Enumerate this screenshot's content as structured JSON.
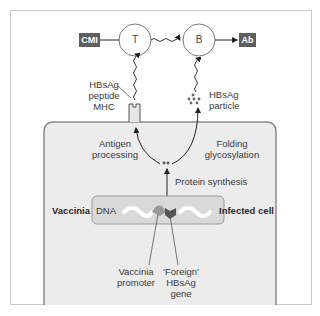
{
  "diagram": {
    "nodes": {
      "cmi": "CMI",
      "t_cell": "T",
      "b_cell": "B",
      "ab": "Ab"
    },
    "labels": {
      "hbsag_peptide_mhc": [
        "HBsAg",
        "peptide",
        "MHC"
      ],
      "hbsag_particle": [
        "HBsAg",
        "particle"
      ],
      "antigen_processing": [
        "Antigen",
        "processing"
      ],
      "folding_glycosylation": [
        "Folding",
        "glycosylation"
      ],
      "protein_synthesis": "Protein synthesis",
      "vaccinia": "Vaccinia",
      "dna": "DNA",
      "infected_cell": "Infected cell",
      "vaccinia_promoter": [
        "Vaccinia",
        "promoter"
      ],
      "foreign_gene": [
        "'Foreign'",
        "HBsAg",
        "gene"
      ]
    },
    "colors": {
      "dark_box": "#5f5f5f",
      "cell_fill": "#ececec",
      "cell_border": "#8a8a8a",
      "dna_box_fill": "#d9d9d9",
      "promoter": "#9a9a9a",
      "gene": "#555555"
    }
  }
}
